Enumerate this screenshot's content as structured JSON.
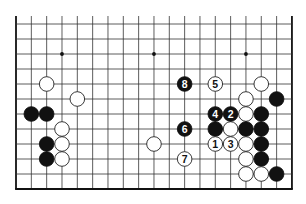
{
  "diagram": {
    "kind": "go-board-diagram",
    "columns": 19,
    "visible_lines": 12,
    "edges": [
      "left",
      "right",
      "bottom"
    ],
    "star_points": [
      {
        "col": 4,
        "line": 10
      },
      {
        "col": 10,
        "line": 10
      },
      {
        "col": 16,
        "line": 10
      }
    ],
    "stones": [
      {
        "color": "black",
        "col": 2,
        "line": 6
      },
      {
        "color": "black",
        "col": 3,
        "line": 6
      },
      {
        "color": "black",
        "col": 3,
        "line": 4
      },
      {
        "color": "black",
        "col": 3,
        "line": 3
      },
      {
        "color": "white",
        "col": 3,
        "line": 8
      },
      {
        "color": "white",
        "col": 5,
        "line": 7
      },
      {
        "color": "white",
        "col": 4,
        "line": 5
      },
      {
        "color": "white",
        "col": 4,
        "line": 4
      },
      {
        "color": "white",
        "col": 4,
        "line": 3
      },
      {
        "color": "white",
        "col": 10,
        "line": 4
      },
      {
        "color": "white",
        "col": 17,
        "line": 8
      },
      {
        "color": "white",
        "col": 16,
        "line": 7
      },
      {
        "color": "black",
        "col": 18,
        "line": 7
      },
      {
        "color": "white",
        "col": 16,
        "line": 6
      },
      {
        "color": "black",
        "col": 17,
        "line": 6
      },
      {
        "color": "black",
        "col": 14,
        "line": 5
      },
      {
        "color": "white",
        "col": 15,
        "line": 5
      },
      {
        "color": "black",
        "col": 16,
        "line": 5
      },
      {
        "color": "black",
        "col": 17,
        "line": 5
      },
      {
        "color": "white",
        "col": 16,
        "line": 4
      },
      {
        "color": "black",
        "col": 17,
        "line": 4
      },
      {
        "color": "white",
        "col": 16,
        "line": 3
      },
      {
        "color": "black",
        "col": 17,
        "line": 3
      },
      {
        "color": "white",
        "col": 16,
        "line": 2
      },
      {
        "color": "white",
        "col": 17,
        "line": 2
      },
      {
        "color": "black",
        "col": 18,
        "line": 2
      }
    ],
    "numbered_moves": [
      {
        "number": "1",
        "color": "white",
        "col": 14,
        "line": 4
      },
      {
        "number": "2",
        "color": "black",
        "col": 15,
        "line": 6
      },
      {
        "number": "3",
        "color": "white",
        "col": 15,
        "line": 4
      },
      {
        "number": "4",
        "color": "black",
        "col": 14,
        "line": 6
      },
      {
        "number": "5",
        "color": "white",
        "col": 14,
        "line": 8
      },
      {
        "number": "6",
        "color": "black",
        "col": 12,
        "line": 5
      },
      {
        "number": "7",
        "color": "white",
        "col": 12,
        "line": 3
      },
      {
        "number": "8",
        "color": "black",
        "col": 12,
        "line": 8
      }
    ]
  },
  "colors": {
    "background": "#ffffff",
    "grid_line": "#333333",
    "edge_line": "#111111",
    "black_stone": "#111111",
    "white_stone": "#ffffff",
    "white_stone_outline": "#222222",
    "label_on_black": "#ffffff",
    "label_on_white": "#111111"
  }
}
